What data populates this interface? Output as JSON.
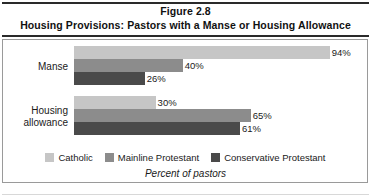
{
  "figure": {
    "number_label": "Figure 2.8",
    "title": "Housing Provisions: Pastors with a Manse or Housing Allowance",
    "caption": "Percent of pastors"
  },
  "legend": {
    "position": "bottom",
    "items": [
      {
        "label": "Catholic",
        "color": "#c6c6c6"
      },
      {
        "label": "Mainline Protestant",
        "color": "#8c8c8c"
      },
      {
        "label": "Conservative Protestant",
        "color": "#4a4a4a"
      }
    ]
  },
  "chart_data": {
    "type": "bar",
    "orientation": "horizontal",
    "title": "Housing Provisions: Pastors with a Manse or Housing Allowance",
    "subtitle": "Figure 2.8",
    "xlabel": "Percent of pastors",
    "ylabel": "",
    "xlim": [
      0,
      100
    ],
    "grid": false,
    "legend_position": "bottom",
    "categories": [
      "Manse",
      "Housing allowance"
    ],
    "category_lines": [
      [
        "Manse"
      ],
      [
        "Housing",
        "allowance"
      ]
    ],
    "series": [
      {
        "name": "Catholic",
        "color": "#c6c6c6",
        "values": [
          94,
          30
        ],
        "labels": [
          "94%",
          "30%"
        ]
      },
      {
        "name": "Mainline Protestant",
        "color": "#8c8c8c",
        "values": [
          40,
          65
        ],
        "labels": [
          "40%",
          "65%"
        ]
      },
      {
        "name": "Conservative Protestant",
        "color": "#4a4a4a",
        "values": [
          26,
          61
        ],
        "labels": [
          "26%",
          "61%"
        ]
      }
    ]
  }
}
